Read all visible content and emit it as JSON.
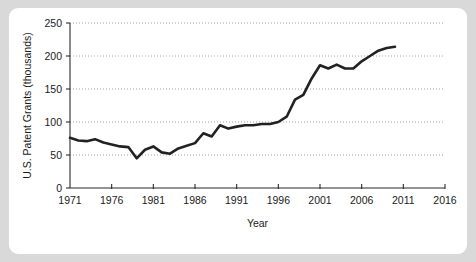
{
  "chart_data": {
    "type": "line",
    "title": "",
    "xlabel": "Year",
    "ylabel": "U.S. Patent Grants (thousands)",
    "xlim": [
      1971,
      2016
    ],
    "ylim": [
      0,
      250
    ],
    "xticks": [
      1971,
      1976,
      1981,
      1986,
      1991,
      1996,
      2001,
      2006,
      2011,
      2016
    ],
    "yticks": [
      0,
      50,
      100,
      150,
      200,
      250
    ],
    "xtick_labels": [
      "1971",
      "1976",
      "1981",
      "1986",
      "1991",
      "1996",
      "2001",
      "2006",
      "2011",
      "2016"
    ],
    "ytick_labels": [
      "0",
      "50",
      "100",
      "150",
      "200",
      "250"
    ],
    "grid": "horizontal-dotted",
    "legend": "none",
    "line_color": "#222222",
    "grid_color": "#9a9a9a",
    "axis_color": "#2b2b2b",
    "x": [
      1971,
      1972,
      1973,
      1974,
      1975,
      1976,
      1977,
      1978,
      1979,
      1980,
      1981,
      1982,
      1983,
      1984,
      1985,
      1986,
      1987,
      1988,
      1989,
      1990,
      1991,
      1992,
      1993,
      1994,
      1995,
      1996,
      1997,
      1998,
      1999,
      2000,
      2001,
      2002,
      2003,
      2004,
      2005,
      2006,
      2007,
      2008,
      2009,
      2010
    ],
    "values": [
      76,
      72,
      71,
      74,
      69,
      66,
      63,
      62,
      45,
      58,
      63,
      54,
      52,
      60,
      64,
      68,
      83,
      78,
      95,
      90,
      93,
      95,
      95,
      97,
      97,
      100,
      108,
      134,
      141,
      166,
      186,
      181,
      187,
      181,
      181,
      192,
      200,
      208,
      212,
      214
    ],
    "data_points": [
      {
        "year": 1971,
        "value": 76
      },
      {
        "year": 1972,
        "value": 72
      },
      {
        "year": 1973,
        "value": 71
      },
      {
        "year": 1974,
        "value": 74
      },
      {
        "year": 1975,
        "value": 69
      },
      {
        "year": 1976,
        "value": 66
      },
      {
        "year": 1977,
        "value": 63
      },
      {
        "year": 1978,
        "value": 62
      },
      {
        "year": 1979,
        "value": 45
      },
      {
        "year": 1980,
        "value": 58
      },
      {
        "year": 1981,
        "value": 63
      },
      {
        "year": 1982,
        "value": 54
      },
      {
        "year": 1983,
        "value": 52
      },
      {
        "year": 1984,
        "value": 60
      },
      {
        "year": 1985,
        "value": 64
      },
      {
        "year": 1986,
        "value": 68
      },
      {
        "year": 1987,
        "value": 83
      },
      {
        "year": 1988,
        "value": 78
      },
      {
        "year": 1989,
        "value": 95
      },
      {
        "year": 1990,
        "value": 90
      },
      {
        "year": 1991,
        "value": 93
      },
      {
        "year": 1992,
        "value": 95
      },
      {
        "year": 1993,
        "value": 95
      },
      {
        "year": 1994,
        "value": 97
      },
      {
        "year": 1995,
        "value": 97
      },
      {
        "year": 1996,
        "value": 100
      },
      {
        "year": 1997,
        "value": 108
      },
      {
        "year": 1998,
        "value": 134
      },
      {
        "year": 1999,
        "value": 141
      },
      {
        "year": 2000,
        "value": 166
      },
      {
        "year": 2001,
        "value": 186
      },
      {
        "year": 2002,
        "value": 181
      },
      {
        "year": 2003,
        "value": 187
      },
      {
        "year": 2004,
        "value": 181
      },
      {
        "year": 2005,
        "value": 181
      },
      {
        "year": 2006,
        "value": 192
      },
      {
        "year": 2007,
        "value": 200
      },
      {
        "year": 2008,
        "value": 208
      },
      {
        "year": 2009,
        "value": 212
      },
      {
        "year": 2010,
        "value": 214
      }
    ]
  }
}
